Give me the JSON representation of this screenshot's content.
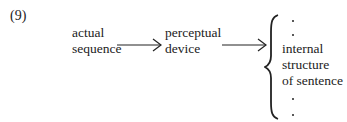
{
  "example_number": "(9)",
  "nodes": {
    "source": {
      "line1": "actual",
      "line2": "sequence"
    },
    "device": {
      "line1": "perceptual",
      "line2": "device"
    },
    "output": {
      "line1": "internal",
      "line2": "structure",
      "line3": "of sentence"
    }
  },
  "edges": [
    {
      "from": "source",
      "to": "device",
      "type": "arrow"
    },
    {
      "from": "device",
      "to": "output",
      "type": "arrow"
    }
  ],
  "output_bracket": {
    "type": "curly-brace",
    "ellipsis_above": 2,
    "ellipsis_below": 2
  }
}
